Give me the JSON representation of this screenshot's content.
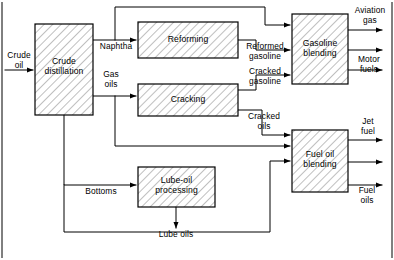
{
  "diagram": {
    "colors": {
      "line": "#000000",
      "box_fill": "#ffffff",
      "hatch": "#7a7a7a",
      "background": "#ffffff"
    },
    "units": [
      {
        "id": "crude-distillation",
        "label": "Crude\ndistillation",
        "x": 35,
        "y": 24,
        "w": 58,
        "h": 91
      },
      {
        "id": "reforming",
        "label": "Reforming",
        "x": 138,
        "y": 22,
        "w": 100,
        "h": 36
      },
      {
        "id": "cracking",
        "label": "Cracking",
        "x": 138,
        "y": 84,
        "w": 100,
        "h": 32
      },
      {
        "id": "gasoline-blending",
        "label": "Gasoline\nblending",
        "x": 292,
        "y": 14,
        "w": 56,
        "h": 70
      },
      {
        "id": "fuel-oil-blending",
        "label": "Fuel oil\nblending",
        "x": 292,
        "y": 130,
        "w": 56,
        "h": 62
      },
      {
        "id": "lube-oil-processing",
        "label": "Lube-oil\nprocessing",
        "x": 138,
        "y": 167,
        "w": 77,
        "h": 40
      }
    ],
    "streams": [
      {
        "id": "crude-oil",
        "label": "Crude\noil"
      },
      {
        "id": "naphtha",
        "label": "Naphtha"
      },
      {
        "id": "gas-oils",
        "label": "Gas\noils"
      },
      {
        "id": "bottoms",
        "label": "Bottoms"
      },
      {
        "id": "reformed-gasoline",
        "label": "Reformed\ngasoline"
      },
      {
        "id": "cracked-gasoline",
        "label": "Cracked\ngasoline"
      },
      {
        "id": "cracked-oils",
        "label": "Cracked\noils"
      },
      {
        "id": "aviation-gas",
        "label": "Aviation\ngas"
      },
      {
        "id": "motor-fuels",
        "label": "Motor\nfuels"
      },
      {
        "id": "jet-fuel",
        "label": "Jet\nfuel"
      },
      {
        "id": "fuel-oils",
        "label": "Fuel\noils"
      },
      {
        "id": "lube-oils",
        "label": "Lube oils"
      }
    ]
  }
}
